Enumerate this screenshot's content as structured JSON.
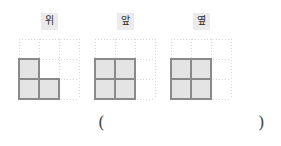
{
  "page": {
    "background_color": "#ffffff"
  },
  "style": {
    "grid_dot_color": "#d8d8d8",
    "cell_fill_color": "#e4e4e4",
    "cell_stroke_color": "#8a8a8a",
    "label_background_color": "#ebebeb",
    "label_text_color": "#2b2b2b",
    "paren_color": "#4a4a4a"
  },
  "grid": {
    "columns": 3,
    "rows": 3,
    "cell_size_px": 20,
    "style": "dotted"
  },
  "views": [
    {
      "id": "view-top",
      "label": "위",
      "label_meaning": "top",
      "filled_cells": [
        {
          "col": 0,
          "row": 1
        },
        {
          "col": 0,
          "row": 2
        },
        {
          "col": 1,
          "row": 2
        }
      ],
      "filled_count": 3,
      "shape": "L"
    },
    {
      "id": "view-front",
      "label": "앞",
      "label_meaning": "front",
      "filled_cells": [
        {
          "col": 0,
          "row": 1
        },
        {
          "col": 1,
          "row": 1
        },
        {
          "col": 0,
          "row": 2
        },
        {
          "col": 1,
          "row": 2
        }
      ],
      "filled_count": 4,
      "shape": "square"
    },
    {
      "id": "view-side",
      "label": "옆",
      "label_meaning": "side",
      "filled_cells": [
        {
          "col": 0,
          "row": 1
        },
        {
          "col": 1,
          "row": 1
        },
        {
          "col": 0,
          "row": 2
        },
        {
          "col": 1,
          "row": 2
        }
      ],
      "filled_count": 4,
      "shape": "square"
    }
  ],
  "answer": {
    "paren_open": "(",
    "paren_close": ")",
    "value": ""
  }
}
